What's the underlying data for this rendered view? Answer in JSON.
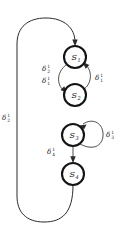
{
  "figure": {
    "kind": "state-transition-diagram",
    "background_color": "#ffffff",
    "stroke_color": "#2b2b2b",
    "node_stroke_color": "#141414"
  },
  "nodes": [
    {
      "id": "s1",
      "name": "S",
      "index": "1",
      "cx": 75,
      "cy": 57,
      "r": 11
    },
    {
      "id": "s2",
      "name": "S",
      "index": "2",
      "cx": 75,
      "cy": 95,
      "r": 11
    },
    {
      "id": "s3",
      "name": "S",
      "index": "3",
      "cx": 73,
      "cy": 135,
      "r": 11
    },
    {
      "id": "s4",
      "name": "S",
      "index": "4",
      "cx": 73,
      "cy": 174,
      "r": 11
    }
  ],
  "edge_labels": {
    "s1_to_s2": {
      "delta": "δ",
      "sub": "2",
      "sup": "1",
      "x": 44,
      "y": 70
    },
    "s1_to_s2_b": {
      "delta": "δ",
      "sub": "1",
      "sup": "1",
      "x": 44,
      "y": 82
    },
    "s2_to_s1": {
      "delta": "δ",
      "sub": "1",
      "sup": "1",
      "x": 96,
      "y": 79
    },
    "s3_self": {
      "delta": "δ",
      "sub": "3",
      "sup": "1",
      "x": 106,
      "y": 136
    },
    "s3_to_s4": {
      "delta": "δ",
      "sub": "4",
      "sup": "1",
      "x": 49,
      "y": 153
    },
    "outer_return": {
      "delta": "δ",
      "sub": "2",
      "sup": "1",
      "x": 3,
      "y": 119
    }
  }
}
